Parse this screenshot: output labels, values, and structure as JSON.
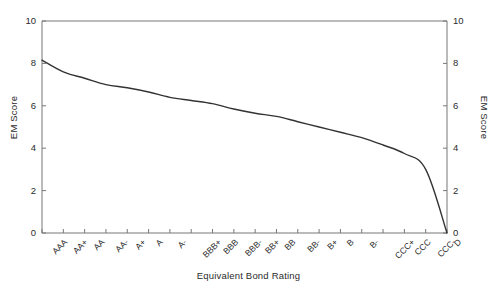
{
  "chart_data": {
    "type": "line",
    "title": "",
    "xlabel": "Equivalent Bond Rating",
    "ylabel": "EM Score",
    "ylabel_right": "EM Score",
    "ylim": [
      0,
      10
    ],
    "yticks": [
      0,
      2,
      4,
      6,
      8,
      10
    ],
    "ytick_labels": [
      "0",
      "2",
      "4",
      "6",
      "8",
      "10"
    ],
    "grid": false,
    "legend": null,
    "line_color": "#333333",
    "categories": [
      "AAA",
      "AA+",
      "AA",
      "AA-",
      "A+",
      "A",
      "A-",
      "BBB+",
      "BBB",
      "BBB-",
      "BB+",
      "BB",
      "BB-",
      "B+",
      "B",
      "B-",
      "CCC+",
      "CCC",
      "CCC-",
      "D"
    ],
    "values": [
      8.15,
      7.6,
      7.3,
      7.0,
      6.85,
      6.65,
      6.4,
      6.25,
      6.1,
      5.85,
      5.65,
      5.5,
      5.25,
      5.0,
      4.75,
      4.5,
      4.15,
      3.75,
      3.0,
      0.0
    ],
    "series": [
      {
        "name": "EM Score",
        "values": [
          8.15,
          7.6,
          7.3,
          7.0,
          6.85,
          6.65,
          6.4,
          6.25,
          6.1,
          5.85,
          5.65,
          5.5,
          5.25,
          5.0,
          4.75,
          4.5,
          4.15,
          3.75,
          3.0,
          0.0
        ]
      }
    ]
  },
  "axes": {
    "left_ticks": [
      "10",
      "8",
      "6",
      "4",
      "2",
      "0"
    ],
    "right_ticks": [
      "10",
      "8",
      "6",
      "4",
      "2",
      "0"
    ],
    "y_title_left": "EM Score",
    "y_title_right": "EM Score",
    "x_title": "Equivalent Bond Rating"
  },
  "x_labels": [
    "AAA",
    "AA+",
    "AA",
    "AA-",
    "A+",
    "A",
    "A-",
    "BBB+",
    "BBB",
    "BBB-",
    "BB+",
    "BB",
    "BB-",
    "B+",
    "B",
    "B-",
    "CCC+",
    "CCC",
    "CCC-",
    "D"
  ]
}
